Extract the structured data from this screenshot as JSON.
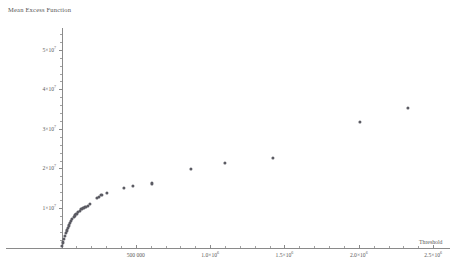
{
  "chart_data": {
    "type": "scatter",
    "title": "Mean Excess Function",
    "xlabel": "Threshold",
    "ylabel": "",
    "xlim": [
      0,
      2600000
    ],
    "ylim": [
      0,
      55000000
    ],
    "grid": false,
    "legend": null,
    "marker_color": "#5b5b63",
    "axis_color": "#8a8a8a",
    "xticks": [
      {
        "value": 500000,
        "label": "500 000"
      },
      {
        "value": 1000000,
        "label": "1.0×10⁶",
        "mantissa": "1.0×10",
        "exp": "6"
      },
      {
        "value": 1500000,
        "label": "1.5×10⁶",
        "mantissa": "1.5×10",
        "exp": "6"
      },
      {
        "value": 2000000,
        "label": "2.0×10⁶",
        "mantissa": "2.0×10",
        "exp": "6"
      },
      {
        "value": 2500000,
        "label": "2.5×10⁶",
        "mantissa": "2.5×10",
        "exp": "6"
      }
    ],
    "yticks": [
      {
        "value": 10000000,
        "label": "1×10⁷",
        "mantissa": "1×10",
        "exp": "7"
      },
      {
        "value": 20000000,
        "label": "2×10⁷",
        "mantissa": "2×10",
        "exp": "7"
      },
      {
        "value": 30000000,
        "label": "3×10⁷",
        "mantissa": "3×10",
        "exp": "7"
      },
      {
        "value": 40000000,
        "label": "4×10⁷",
        "mantissa": "4×10",
        "exp": "7"
      },
      {
        "value": 50000000,
        "label": "5×10⁷",
        "mantissa": "5×10",
        "exp": "7"
      }
    ],
    "points": [
      {
        "x": 4000,
        "y": 500000
      },
      {
        "x": 9000,
        "y": 1300000
      },
      {
        "x": 15000,
        "y": 2100000
      },
      {
        "x": 21000,
        "y": 2900000
      },
      {
        "x": 27000,
        "y": 3600000
      },
      {
        "x": 34000,
        "y": 4300000
      },
      {
        "x": 41000,
        "y": 5000000
      },
      {
        "x": 48000,
        "y": 5600000
      },
      {
        "x": 56000,
        "y": 6200000
      },
      {
        "x": 64000,
        "y": 6700000
      },
      {
        "x": 72000,
        "y": 7200000
      },
      {
        "x": 81000,
        "y": 7700000
      },
      {
        "x": 90000,
        "y": 8100000
      },
      {
        "x": 100000,
        "y": 8500000
      },
      {
        "x": 111000,
        "y": 8900000
      },
      {
        "x": 122000,
        "y": 9300000
      },
      {
        "x": 134000,
        "y": 9700000
      },
      {
        "x": 147000,
        "y": 10000000
      },
      {
        "x": 161000,
        "y": 10300000
      },
      {
        "x": 176000,
        "y": 10600000
      },
      {
        "x": 193000,
        "y": 11000000
      },
      {
        "x": 238000,
        "y": 12500000
      },
      {
        "x": 252000,
        "y": 12800000
      },
      {
        "x": 268000,
        "y": 13200000
      },
      {
        "x": 305000,
        "y": 13900000
      },
      {
        "x": 420000,
        "y": 15000000
      },
      {
        "x": 480000,
        "y": 15600000
      },
      {
        "x": 610000,
        "y": 16200000
      },
      {
        "x": 870000,
        "y": 19800000
      },
      {
        "x": 1100000,
        "y": 21300000
      },
      {
        "x": 1420000,
        "y": 22600000
      },
      {
        "x": 2010000,
        "y": 31800000
      },
      {
        "x": 2330000,
        "y": 35200000
      }
    ]
  }
}
